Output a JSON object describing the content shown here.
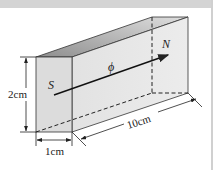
{
  "diagram": {
    "type": "rectangular-prism-magnet",
    "labels": {
      "south_pole": "S",
      "north_pole": "N",
      "flux": "ϕ",
      "height": "2cm",
      "width": "1cm",
      "length": "10cm"
    },
    "colors": {
      "front_face": "#dcdcdc",
      "side_face": "#e8e8e8",
      "top_face_dark": "#9a9a9a",
      "top_face_light": "#d8d8d8",
      "lines": "#222222"
    }
  }
}
